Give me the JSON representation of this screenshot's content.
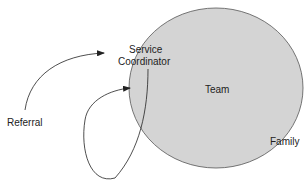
{
  "diagram": {
    "labels": {
      "referral": "Referral",
      "service_line1": "Service",
      "service_line2": "Coordinator",
      "team": "Team",
      "family": "Family"
    },
    "colors": {
      "circle_fill": "#d4d4d4",
      "circle_stroke": "#555555",
      "line": "#222222"
    }
  }
}
